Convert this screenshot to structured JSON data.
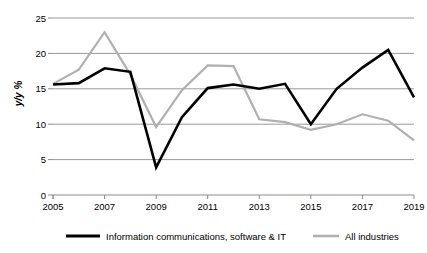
{
  "chart_data": {
    "type": "line",
    "title": "",
    "subtitle": "",
    "xlabel": "",
    "ylabel": "y/y %",
    "x": [
      2005,
      2006,
      2007,
      2008,
      2009,
      2010,
      2011,
      2012,
      2013,
      2014,
      2015,
      2016,
      2017,
      2018,
      2019
    ],
    "xtick_labels": [
      "2005",
      "2007",
      "2009",
      "2011",
      "2013",
      "2015",
      "2017",
      "2019"
    ],
    "xtick_values": [
      2005,
      2007,
      2009,
      2011,
      2013,
      2015,
      2017,
      2019
    ],
    "ytick_labels": [
      "0",
      "5",
      "10",
      "15",
      "20",
      "25"
    ],
    "ytick_values": [
      0,
      5,
      10,
      15,
      20,
      25
    ],
    "ylim": [
      0,
      25
    ],
    "xlim": [
      2005,
      2019
    ],
    "grid": "horizontal",
    "legend_position": "bottom",
    "series": [
      {
        "name": "Information communications, software & IT",
        "color": "#000000",
        "width": 2.6,
        "values": [
          15.6,
          15.8,
          17.9,
          17.4,
          3.9,
          11.0,
          15.1,
          15.6,
          15.0,
          15.7,
          10.0,
          15.0,
          18.0,
          20.5,
          13.8
        ]
      },
      {
        "name": "All industries",
        "color": "#b0b0b0",
        "width": 2.2,
        "values": [
          15.7,
          17.7,
          23.0,
          17.0,
          9.6,
          14.8,
          18.3,
          18.2,
          10.7,
          10.3,
          9.2,
          10.0,
          11.4,
          10.5,
          7.7
        ]
      }
    ]
  },
  "colors": {
    "series_black": "#000000",
    "series_grey": "#b0b0b0",
    "gridline": "#9a9a9a",
    "axis": "#8c8c8c",
    "background": "#ffffff",
    "text": "#000000"
  },
  "axis": {
    "y_title": "y/y %",
    "y_ticks": [
      "25",
      "20",
      "15",
      "10",
      "5",
      "0"
    ],
    "x_ticks": [
      "2005",
      "2007",
      "2009",
      "2011",
      "2013",
      "2015",
      "2017",
      "2019"
    ]
  },
  "legend": {
    "items": [
      {
        "label": "Information communications, software & IT",
        "color": "#000000"
      },
      {
        "label": "All industries",
        "color": "#b0b0b0"
      }
    ]
  }
}
